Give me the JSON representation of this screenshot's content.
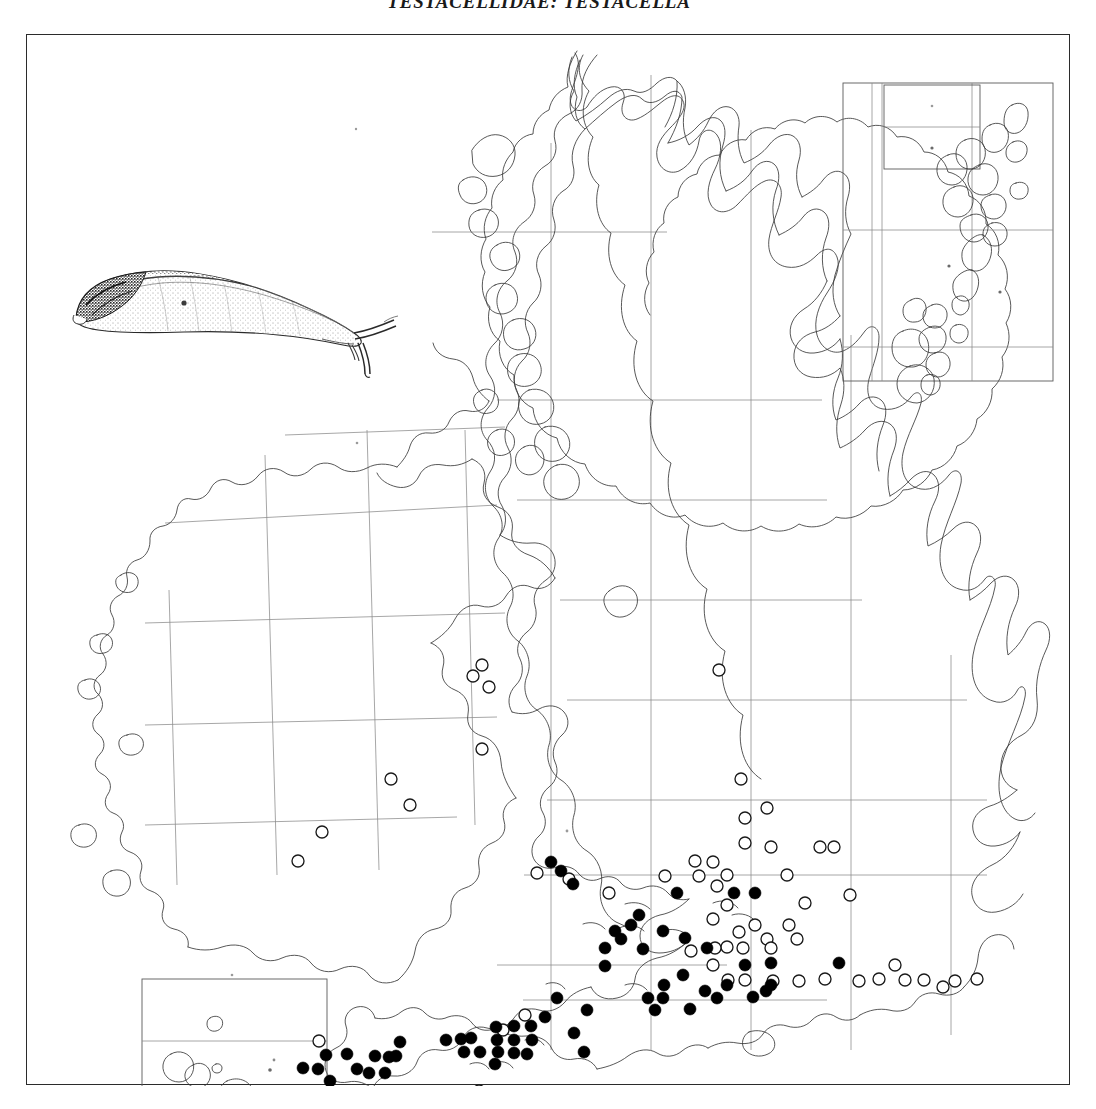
{
  "page": {
    "running_head": "TESTACELLIDAE: TESTACELLA",
    "width": 1096,
    "height": 1109,
    "background_color": "#ffffff"
  },
  "figure": {
    "illustration_name": "testacella-slug-drawing",
    "illustration_caption": "",
    "style": "stippled ink line drawing of a shelled slug, facing right"
  },
  "map": {
    "title": "",
    "region": "British Isles and Ireland",
    "frame_color": "#2b2b2b",
    "grid_color": "#8a8a8a",
    "coast_color": "#3a3a3a",
    "insets": [
      {
        "name": "shetland-orkney-inset",
        "label": ""
      },
      {
        "name": "fair-isle-subinset",
        "label": ""
      },
      {
        "name": "channel-islands-inset",
        "label": ""
      }
    ],
    "symbols": [
      {
        "key": "filled",
        "name": "filled-circle-symbol",
        "label": "",
        "color": "#000000"
      },
      {
        "key": "open",
        "name": "open-circle-symbol",
        "label": "",
        "color": "#ffffff"
      }
    ]
  },
  "chart_data": {
    "type": "scatter",
    "title": "TESTACELLIDAE: TESTACELLA",
    "subtitle": "",
    "xlabel": "",
    "ylabel": "",
    "xlim": [
      0,
      1044
    ],
    "ylim": [
      0,
      1051
    ],
    "grid": true,
    "legend_position": "none",
    "projection": "British National Grid / Irish Grid hectad map",
    "series": [
      {
        "name": "filled",
        "symbol": "filled circle",
        "color": "#000000",
        "radius": 6,
        "count": 62,
        "points": [
          [
            524,
            827
          ],
          [
            546,
            849
          ],
          [
            650,
            858
          ],
          [
            707,
            858
          ],
          [
            728,
            858
          ],
          [
            588,
            896
          ],
          [
            578,
            913
          ],
          [
            578,
            931
          ],
          [
            594,
            904
          ],
          [
            636,
            896
          ],
          [
            658,
            903
          ],
          [
            530,
            963
          ],
          [
            637,
            950
          ],
          [
            636,
            963
          ],
          [
            678,
            956
          ],
          [
            690,
            963
          ],
          [
            739,
            956
          ],
          [
            663,
            974
          ],
          [
            726,
            962
          ],
          [
            547,
            998
          ],
          [
            557,
            1017
          ],
          [
            444,
            1003
          ],
          [
            437,
            1017
          ],
          [
            453,
            1017
          ],
          [
            471,
            1017
          ],
          [
            469,
            992
          ],
          [
            487,
            991
          ],
          [
            504,
            991
          ],
          [
            487,
            1005
          ],
          [
            505,
            1005
          ],
          [
            470,
            1005
          ],
          [
            487,
            1018
          ],
          [
            373,
            1007
          ],
          [
            348,
            1021
          ],
          [
            362,
            1022
          ],
          [
            342,
            1038
          ],
          [
            358,
            1038
          ],
          [
            299,
            1020
          ],
          [
            291,
            1034
          ],
          [
            303,
            1046
          ],
          [
            621,
            963
          ],
          [
            700,
            950
          ],
          [
            468,
            1029
          ],
          [
            616,
            914
          ],
          [
            612,
            880
          ],
          [
            534,
            836
          ],
          [
            604,
            890
          ],
          [
            680,
            913
          ],
          [
            718,
            930
          ],
          [
            744,
            950
          ],
          [
            419,
            1005
          ],
          [
            434,
            1004
          ],
          [
            320,
            1019
          ],
          [
            276,
            1033
          ],
          [
            330,
            1034
          ],
          [
            500,
            1019
          ],
          [
            656,
            940
          ],
          [
            518,
            982
          ],
          [
            560,
            975
          ],
          [
            628,
            975
          ],
          [
            744,
            928
          ],
          [
            812,
            928
          ],
          [
            369,
            1021
          ]
        ]
      },
      {
        "name": "open",
        "symbol": "open circle",
        "color": "#ffffff",
        "radius": 6,
        "count": 58,
        "points": [
          [
            455,
            630
          ],
          [
            455,
            714
          ],
          [
            364,
            744
          ],
          [
            383,
            770
          ],
          [
            295,
            797
          ],
          [
            271,
            826
          ],
          [
            446,
            641
          ],
          [
            462,
            652
          ],
          [
            692,
            635
          ],
          [
            718,
            783
          ],
          [
            718,
            808
          ],
          [
            740,
            773
          ],
          [
            714,
            744
          ],
          [
            744,
            812
          ],
          [
            793,
            812
          ],
          [
            690,
            851
          ],
          [
            760,
            840
          ],
          [
            778,
            868
          ],
          [
            807,
            812
          ],
          [
            823,
            860
          ],
          [
            638,
            841
          ],
          [
            668,
            826
          ],
          [
            686,
            827
          ],
          [
            700,
            840
          ],
          [
            672,
            841
          ],
          [
            700,
            870
          ],
          [
            686,
            884
          ],
          [
            712,
            897
          ],
          [
            728,
            890
          ],
          [
            740,
            904
          ],
          [
            762,
            890
          ],
          [
            700,
            912
          ],
          [
            716,
            913
          ],
          [
            688,
            913
          ],
          [
            744,
            913
          ],
          [
            770,
            904
          ],
          [
            664,
            916
          ],
          [
            686,
            930
          ],
          [
            701,
            945
          ],
          [
            718,
            945
          ],
          [
            746,
            946
          ],
          [
            772,
            946
          ],
          [
            798,
            944
          ],
          [
            832,
            946
          ],
          [
            852,
            944
          ],
          [
            878,
            945
          ],
          [
            897,
            945
          ],
          [
            916,
            952
          ],
          [
            928,
            946
          ],
          [
            950,
            944
          ],
          [
            868,
            930
          ],
          [
            510,
            838
          ],
          [
            542,
            844
          ],
          [
            582,
            858
          ],
          [
            498,
            980
          ],
          [
            476,
            995
          ],
          [
            292,
            1006
          ],
          [
            452,
            1056
          ]
        ]
      }
    ]
  }
}
